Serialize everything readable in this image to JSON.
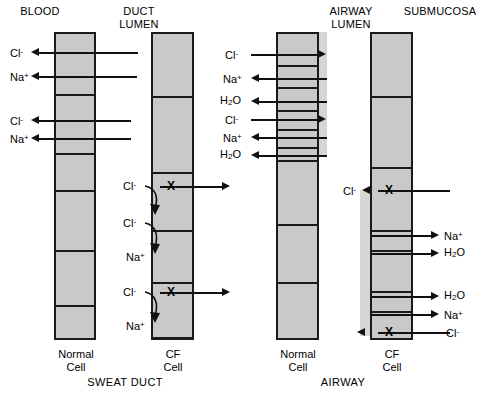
{
  "figure": {
    "headers": {
      "blood": "BLOOD",
      "duct_lumen": "DUCT\nLUMEN",
      "airway_lumen": "AIRWAY\nLUMEN",
      "submucosa": "SUBMUCOSA"
    },
    "section_labels": {
      "sweat_duct": "SWEAT DUCT",
      "airway": "AIRWAY"
    },
    "cell_labels": {
      "normal": "Normal\nCell",
      "cf": "CF\nCell"
    },
    "colors": {
      "cell_fill": "#c9c9c9",
      "cell_border": "#1a1a1a",
      "mucus_layer": "#d6d6d6",
      "arrow": "#111111",
      "background": "#ffffff"
    },
    "blocked_channel_marker": "X"
  },
  "panels": [
    {
      "id": "sweat-duct-normal",
      "name": "Sweat Duct Normal Cell",
      "cell_label": "Normal\nCell",
      "blocked_channels": 0,
      "transport": [
        {
          "species": "Cl",
          "charge": "-",
          "label": "Cl",
          "sup": "-",
          "direction": "to-blood",
          "blocked": false
        },
        {
          "species": "Na",
          "charge": "+",
          "label": "Na",
          "sup": "+",
          "direction": "to-blood",
          "blocked": false
        },
        {
          "species": "Cl",
          "charge": "-",
          "label": "Cl",
          "sup": "-",
          "direction": "to-blood",
          "blocked": false
        },
        {
          "species": "Na",
          "charge": "+",
          "label": "Na",
          "sup": "+",
          "direction": "to-blood",
          "blocked": false
        }
      ]
    },
    {
      "id": "sweat-duct-cf",
      "name": "Sweat Duct CF Cell",
      "cell_label": "CF\nCell",
      "blocked_channels": 2,
      "transport": [
        {
          "species": "Cl",
          "charge": "-",
          "label": "Cl",
          "sup": "-",
          "direction": "blocked-reflected",
          "blocked": true
        },
        {
          "species": "Cl",
          "charge": "-",
          "label": "Cl",
          "sup": "-",
          "direction": "reflected",
          "blocked": true
        },
        {
          "species": "Na",
          "charge": "+",
          "label": "Na",
          "sup": "+",
          "direction": "reflected",
          "blocked": true
        },
        {
          "species": "Cl",
          "charge": "-",
          "label": "Cl",
          "sup": "-",
          "direction": "blocked-reflected",
          "blocked": true
        },
        {
          "species": "Na",
          "charge": "+",
          "label": "Na",
          "sup": "+",
          "direction": "reflected",
          "blocked": true
        }
      ]
    },
    {
      "id": "airway-normal",
      "name": "Airway Normal Cell",
      "cell_label": "Normal\nCell",
      "blocked_channels": 0,
      "transport": [
        {
          "species": "Cl",
          "label": "Cl",
          "sup": "-",
          "direction": "to-lumen",
          "blocked": false
        },
        {
          "species": "Na",
          "label": "Na",
          "sup": "+",
          "direction": "to-submucosa",
          "blocked": false
        },
        {
          "species": "H2O",
          "label": "H",
          "sub": "2",
          "tail": "O",
          "direction": "to-submucosa",
          "blocked": false
        },
        {
          "species": "Cl",
          "label": "Cl",
          "sup": "-",
          "direction": "to-lumen",
          "blocked": false
        },
        {
          "species": "Na",
          "label": "Na",
          "sup": "+",
          "direction": "to-submucosa",
          "blocked": false
        },
        {
          "species": "H2O",
          "label": "H",
          "sub": "2",
          "tail": "O",
          "direction": "to-submucosa",
          "blocked": false
        }
      ]
    },
    {
      "id": "airway-cf",
      "name": "Airway CF Cell",
      "cell_label": "CF\nCell",
      "blocked_channels": 2,
      "transport": [
        {
          "species": "Cl",
          "label": "Cl",
          "sup": "-",
          "direction": "blocked-to-lumen",
          "blocked": true
        },
        {
          "species": "Na",
          "label": "Na",
          "sup": "+",
          "direction": "to-submucosa",
          "blocked": false
        },
        {
          "species": "H2O",
          "label": "H",
          "sub": "2",
          "tail": "O",
          "direction": "to-submucosa",
          "blocked": false
        },
        {
          "species": "H2O",
          "label": "H",
          "sub": "2",
          "tail": "O",
          "direction": "to-submucosa",
          "blocked": false
        },
        {
          "species": "Na",
          "label": "Na",
          "sup": "+",
          "direction": "to-submucosa",
          "blocked": false
        },
        {
          "species": "Cl",
          "label": "Cl",
          "sup": "-",
          "direction": "blocked-to-lumen",
          "blocked": true
        }
      ]
    }
  ],
  "labels": {
    "sd_normal": {
      "cl1": "Cl",
      "cl1_sup": "-",
      "na1": "Na",
      "na1_sup": "+",
      "cl2": "Cl",
      "cl2_sup": "-",
      "na2": "Na",
      "na2_sup": "+"
    },
    "sd_cf": {
      "cl1": "Cl",
      "cl1_sup": "-",
      "cl2": "Cl",
      "cl2_sup": "-",
      "na1": "Na",
      "na1_sup": "+",
      "cl3": "Cl",
      "cl3_sup": "-",
      "na2": "Na",
      "na2_sup": "+"
    },
    "aw_normal": {
      "cl1": "Cl",
      "cl1_sup": "-",
      "na1": "Na",
      "na1_sup": "+",
      "h2o1_a": "H",
      "h2o1_b": "2",
      "h2o1_c": "O",
      "cl2": "Cl",
      "cl2_sup": "-",
      "na2": "Na",
      "na2_sup": "+",
      "h2o2_a": "H",
      "h2o2_b": "2",
      "h2o2_c": "O"
    },
    "aw_cf": {
      "cl_top": "Cl",
      "cl_top_sup": "-",
      "na1": "Na",
      "na1_sup": "+",
      "h2o1_a": "H",
      "h2o1_b": "2",
      "h2o1_c": "O",
      "h2o2_a": "H",
      "h2o2_b": "2",
      "h2o2_c": "O",
      "na2": "Na",
      "na2_sup": "+",
      "cl_bot": "Cl",
      "cl_bot_sup": "-"
    }
  },
  "xmarks": {
    "m": "X"
  }
}
